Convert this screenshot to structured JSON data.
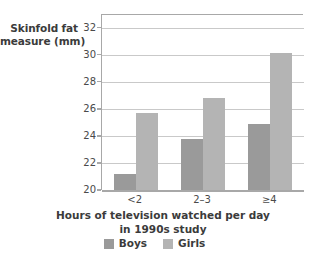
{
  "chart_data": {
    "type": "bar",
    "title": "",
    "subtitle": "",
    "xlabel": "Hours of television watched per day in 1990s study",
    "xlabel_line1": "Hours of television watched per day",
    "xlabel_line2": "in 1990s study",
    "ylabel": "Skinfold fat measure (mm)",
    "ylabel_line1": "Skinfold fat",
    "ylabel_line2": "measure (mm)",
    "categories": [
      "<2",
      "2–3",
      "≥4"
    ],
    "series": [
      {
        "name": "Boys",
        "color": "#9a9a9a",
        "values": [
          21.2,
          23.8,
          24.9
        ]
      },
      {
        "name": "Girls",
        "color": "#b4b4b4",
        "values": [
          25.7,
          26.8,
          30.1
        ]
      }
    ],
    "ylim": [
      20,
      33
    ],
    "yticks": [
      20,
      22,
      24,
      26,
      28,
      30,
      32
    ],
    "ytick_labels": [
      "20",
      "22",
      "24",
      "26",
      "28",
      "30",
      "32"
    ],
    "grid": "horizontal",
    "legend_position": "bottom",
    "axis_color": "#a8a8a8",
    "grid_color": "#c9c9c9",
    "background": "#ffffff"
  },
  "legend": {
    "entries": [
      {
        "label": "Boys"
      },
      {
        "label": "Girls"
      }
    ]
  }
}
